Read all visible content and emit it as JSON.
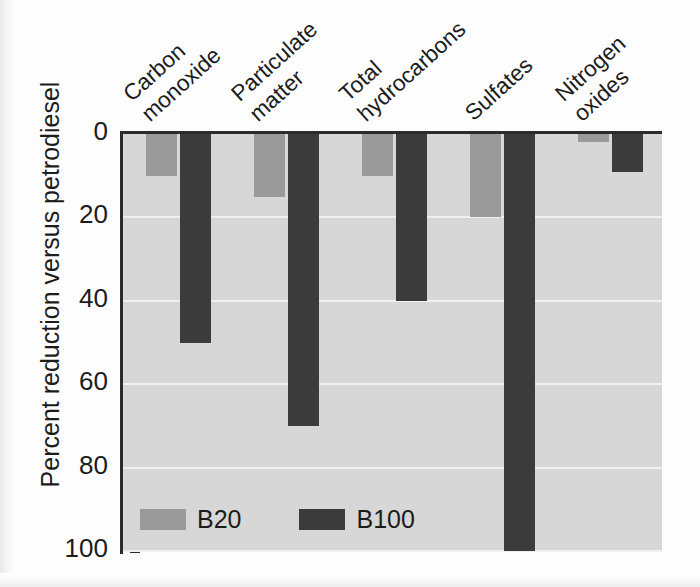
{
  "chart_data": {
    "type": "bar",
    "title": "",
    "xlabel": "",
    "ylabel": "Percent reduction versus petrodiesel",
    "ylim": [
      0,
      100
    ],
    "y_axis_inverted": true,
    "grid": true,
    "legend_position": "bottom-left",
    "categories": [
      "Carbon monoxide",
      "Particulate matter",
      "Total hydrocarbons",
      "Sulfates",
      "Nitrogen oxides"
    ],
    "category_lines": [
      [
        "Carbon",
        "monoxide"
      ],
      [
        "Particulate",
        "matter"
      ],
      [
        "Total",
        "hydrocarbons"
      ],
      [
        "Sulfates",
        ""
      ],
      [
        "Nitrogen",
        "oxides"
      ]
    ],
    "yticks": [
      0,
      20,
      40,
      60,
      80,
      100
    ],
    "ytick_labels": [
      "0",
      "20",
      "40",
      "60",
      "80",
      "100"
    ],
    "series": [
      {
        "name": "B20",
        "color": "#9a9a9a",
        "values": [
          10,
          15,
          10,
          20,
          2
        ]
      },
      {
        "name": "B100",
        "color": "#3b3b3b",
        "values": [
          50,
          70,
          40,
          100,
          9
        ]
      }
    ]
  },
  "legend": {
    "items": [
      {
        "label": "B20"
      },
      {
        "label": "B100"
      }
    ]
  },
  "colors": {
    "plot_background": "#d7d7d7",
    "gridline": "#f0f0f0",
    "axis": "#2b2b2b",
    "b20": "#9a9a9a",
    "b100": "#3b3b3b",
    "text": "#1c1c1c",
    "page_background": "#fdfdfd"
  }
}
